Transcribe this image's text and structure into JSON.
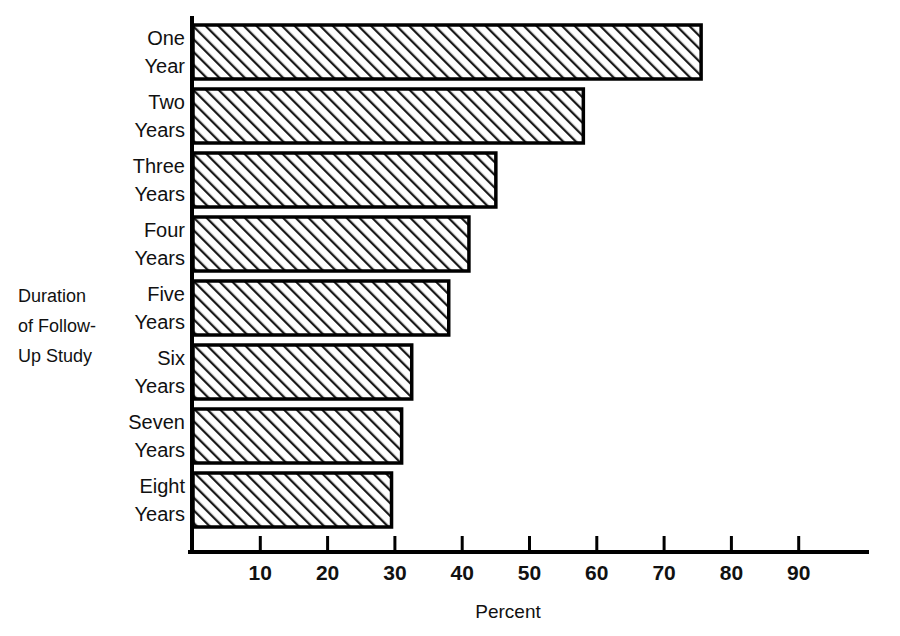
{
  "chart_data": {
    "type": "bar",
    "orientation": "horizontal",
    "title": "",
    "xlabel": "Percent",
    "ylabel": "Duration of Follow-Up Study",
    "ylabel_lines": [
      "Duration",
      "of Follow-",
      "Up Study"
    ],
    "categories": [
      "One Year",
      "Two Years",
      "Three Years",
      "Four Years",
      "Five Years",
      "Six Years",
      "Seven Years",
      "Eight Years"
    ],
    "category_lines": [
      [
        "One",
        "Year"
      ],
      [
        "Two",
        "Years"
      ],
      [
        "Three",
        "Years"
      ],
      [
        "Four",
        "Years"
      ],
      [
        "Five",
        "Years"
      ],
      [
        "Six",
        "Years"
      ],
      [
        "Seven",
        "Years"
      ],
      [
        "Eight",
        "Years"
      ]
    ],
    "values": [
      75.5,
      58,
      45,
      41,
      38,
      32.5,
      31,
      29.5
    ],
    "xlim": [
      0,
      100
    ],
    "xticks": [
      10,
      20,
      30,
      40,
      50,
      60,
      70,
      80,
      90
    ],
    "xtick_labels": [
      "10",
      "20",
      "30",
      "40",
      "50",
      "60",
      "70",
      "80",
      "90"
    ],
    "grid": false,
    "legend": null,
    "bar_fill": "#ffffff",
    "bar_hatch": "diagonal-45",
    "bar_stroke": "#000000",
    "background": "#ffffff"
  }
}
